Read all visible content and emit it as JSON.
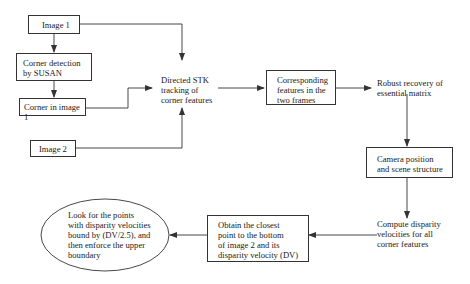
{
  "diagram": {
    "nodes": [
      {
        "id": "image1",
        "label": "Image 1"
      },
      {
        "id": "corner_detection",
        "label": "Corner detection\nby SUSAN"
      },
      {
        "id": "corner_in_image1",
        "label": "Corner in image 1"
      },
      {
        "id": "image2",
        "label": "Image 2"
      },
      {
        "id": "directed_stk",
        "label": "Directed STK\ntracking of\ncorner features"
      },
      {
        "id": "corresponding",
        "label": "Corresponding\nfeatures in the\ntwo frames"
      },
      {
        "id": "robust_recovery",
        "label": "Robust recovery of\nessential matrix"
      },
      {
        "id": "camera_position",
        "label": "Camera position\nand scene structure"
      },
      {
        "id": "compute_disparity",
        "label": "Compute disparity\nvelocities for all\ncorner features"
      },
      {
        "id": "obtain_closest",
        "label": "Obtain the closest\npoint to the bottom\nof image 2 and its\ndisparity velocity (DV)"
      },
      {
        "id": "look_for_points",
        "label": "Look for the points\nwith disparity velocities\nbound by (DV/2.5), and\nthen enforce the upper\nboundary"
      }
    ],
    "edges": [
      {
        "from": "image1",
        "to": "corner_detection"
      },
      {
        "from": "corner_detection",
        "to": "corner_in_image1"
      },
      {
        "from": "image1",
        "to": "directed_stk"
      },
      {
        "from": "corner_in_image1",
        "to": "directed_stk"
      },
      {
        "from": "image2",
        "to": "directed_stk"
      },
      {
        "from": "directed_stk",
        "to": "corresponding"
      },
      {
        "from": "corresponding",
        "to": "robust_recovery"
      },
      {
        "from": "robust_recovery",
        "to": "camera_position"
      },
      {
        "from": "camera_position",
        "to": "compute_disparity"
      },
      {
        "from": "compute_disparity",
        "to": "obtain_closest"
      },
      {
        "from": "obtain_closest",
        "to": "look_for_points"
      }
    ],
    "colors": {
      "line": "#333333",
      "text": "#1a1a1a",
      "background": "#ffffff"
    }
  }
}
